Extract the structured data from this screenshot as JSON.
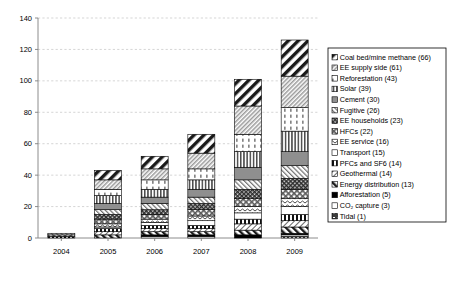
{
  "chart_data": {
    "type": "bar",
    "subtype": "stacked-bar",
    "title": "",
    "xlabel": "",
    "ylabel": "",
    "ylim": [
      0,
      140
    ],
    "ytick_step": 20,
    "yticks": [
      "0",
      "20",
      "40",
      "60",
      "80",
      "100",
      "120",
      "140"
    ],
    "grid": true,
    "legend_position": "right",
    "categories": [
      "2004",
      "2005",
      "2006",
      "2007",
      "2008",
      "2009"
    ],
    "series": [
      {
        "name": "Tidal",
        "total": 1,
        "pattern": "tidal",
        "values": [
          0,
          0,
          0,
          0,
          0,
          1
        ]
      },
      {
        "name": "CO₂ capture",
        "total": 3,
        "pattern": "co2",
        "values": [
          0,
          0,
          1,
          1,
          0,
          1
        ]
      },
      {
        "name": "Afforestation",
        "total": 5,
        "pattern": "afforestation",
        "values": [
          0,
          0,
          1,
          1,
          2,
          1
        ]
      },
      {
        "name": "Energy distribution",
        "total": 13,
        "pattern": "energydist",
        "values": [
          0,
          2,
          2,
          2,
          3,
          4
        ]
      },
      {
        "name": "Geothermal",
        "total": 14,
        "pattern": "geothermal",
        "values": [
          0,
          2,
          2,
          2,
          4,
          4
        ]
      },
      {
        "name": "PFCs and SF6",
        "total": 14,
        "pattern": "pfcs",
        "values": [
          1,
          2,
          2,
          2,
          3,
          4
        ]
      },
      {
        "name": "Transport",
        "total": 15,
        "pattern": "transport",
        "values": [
          0,
          1,
          2,
          3,
          4,
          5
        ]
      },
      {
        "name": "EE service",
        "total": 16,
        "pattern": "eeservice",
        "values": [
          0,
          2,
          2,
          3,
          4,
          5
        ]
      },
      {
        "name": "HFCs",
        "total": 22,
        "pattern": "hfcs",
        "values": [
          1,
          3,
          3,
          4,
          5,
          6
        ]
      },
      {
        "name": "EE households",
        "total": 23,
        "pattern": "eehouseholds",
        "values": [
          0,
          3,
          3,
          4,
          6,
          7
        ]
      },
      {
        "name": "Fugitive",
        "total": 26,
        "pattern": "fugitive",
        "values": [
          1,
          3,
          4,
          4,
          6,
          8
        ]
      },
      {
        "name": "Cement",
        "total": 30,
        "pattern": "cement",
        "values": [
          0,
          4,
          4,
          5,
          8,
          9
        ]
      },
      {
        "name": "Solar",
        "total": 39,
        "pattern": "solar",
        "values": [
          0,
          5,
          5,
          6,
          10,
          13
        ]
      },
      {
        "name": "Reforestation",
        "total": 43,
        "pattern": "reforestation",
        "values": [
          0,
          4,
          6,
          7,
          11,
          15
        ]
      },
      {
        "name": "EE supply side",
        "total": 61,
        "pattern": "eesupply",
        "values": [
          0,
          6,
          7,
          10,
          18,
          20
        ]
      },
      {
        "name": "Coal bed/mine methane",
        "total": 66,
        "pattern": "coalbed",
        "values": [
          0,
          6,
          8,
          12,
          17,
          23
        ]
      }
    ],
    "bar_totals": [
      3,
      43,
      47,
      66,
      108,
      122
    ]
  },
  "legend": {
    "items": [
      {
        "label": "Coal bed/mine methane (66)",
        "pattern": "coalbed"
      },
      {
        "label": "EE supply side (61)",
        "pattern": "eesupply"
      },
      {
        "label": "Reforestation (43)",
        "pattern": "reforestation"
      },
      {
        "label": "Solar (39)",
        "pattern": "solar"
      },
      {
        "label": "Cement (30)",
        "pattern": "cement"
      },
      {
        "label": "Fugitive (26)",
        "pattern": "fugitive"
      },
      {
        "label": "EE households (23)",
        "pattern": "eehouseholds"
      },
      {
        "label": "HFCs (22)",
        "pattern": "hfcs"
      },
      {
        "label": "EE service (16)",
        "pattern": "eeservice"
      },
      {
        "label": "Transport (15)",
        "pattern": "transport"
      },
      {
        "label": "PFCs and SF6 (14)",
        "pattern": "pfcs"
      },
      {
        "label": "Geothermal (14)",
        "pattern": "geothermal"
      },
      {
        "label": "Energy distribution (13)",
        "pattern": "energydist"
      },
      {
        "label": "Afforestation (5)",
        "pattern": "afforestation"
      },
      {
        "label": "CO₂ capture (3)",
        "pattern": "co2"
      },
      {
        "label": "Tidal (1)",
        "pattern": "tidal"
      }
    ]
  },
  "colors": {
    "axis": "#808080",
    "grid": "#b9b9b9",
    "outline": "#000000",
    "background": "#ffffff"
  }
}
